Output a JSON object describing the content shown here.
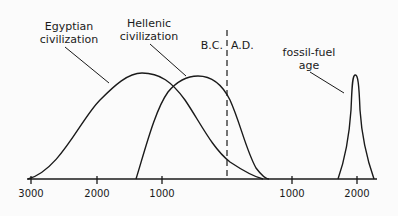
{
  "diagram": {
    "labels": {
      "egyptian_line1": "Egyptian",
      "egyptian_line2": "civilization",
      "hellenic_line1": "Hellenic",
      "hellenic_line2": "civilization",
      "bc": "B.C.",
      "ad": "A.D.",
      "fossil_line1": "fossil-fuel",
      "fossil_line2": "age"
    },
    "axis": {
      "ticks": [
        "3000",
        "2000",
        "1000",
        "1000",
        "2000"
      ]
    },
    "colors": {
      "ink": "#1a1a1a",
      "background": "#fbfbfb"
    }
  }
}
